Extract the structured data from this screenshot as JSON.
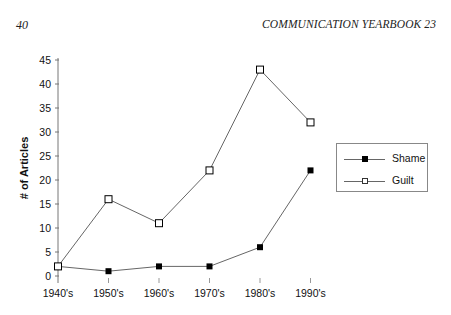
{
  "header": {
    "page_number": "40",
    "running_head": "COMMUNICATION YEARBOOK 23"
  },
  "chart_data": {
    "type": "line",
    "title": "",
    "xlabel": "",
    "ylabel": "# of Articles",
    "categories": [
      "1940's",
      "1950's",
      "1960's",
      "1970's",
      "1980's",
      "1990's"
    ],
    "series": [
      {
        "name": "Shame",
        "marker": "filled-square",
        "values": [
          2,
          1,
          2,
          2,
          6,
          22
        ]
      },
      {
        "name": "Guilt",
        "marker": "hollow-square",
        "values": [
          2,
          16,
          11,
          22,
          43,
          32
        ]
      }
    ],
    "ylim": [
      0,
      45
    ],
    "yticks": [
      0,
      5,
      10,
      15,
      20,
      25,
      30,
      35,
      40,
      45
    ],
    "grid": false,
    "legend_position": "right"
  },
  "colors": {
    "line": "#666666",
    "marker": "#000000",
    "axis": "#777777"
  }
}
